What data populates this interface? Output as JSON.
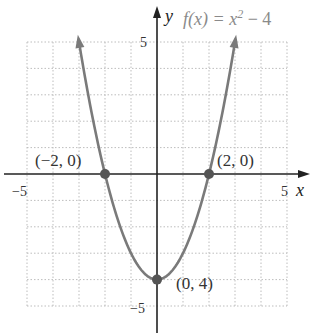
{
  "chart_data": {
    "type": "line",
    "title_parts": {
      "prefix": "f(x) = x",
      "exponent": "2",
      "suffix": " − 4"
    },
    "xlabel": "x",
    "ylabel": "y",
    "xlim": [
      -5,
      5
    ],
    "ylim": [
      -5,
      5
    ],
    "grid": true,
    "x_ticks": [
      {
        "value": -5,
        "label": "−5"
      },
      {
        "value": 5,
        "label": "5"
      }
    ],
    "y_ticks": [
      {
        "value": 5,
        "label": "5"
      },
      {
        "value": -5,
        "label": "−5"
      }
    ],
    "series": [
      {
        "name": "f(x) = x^2 - 4",
        "function": "x^2 - 4",
        "x": [
          -3,
          -2.5,
          -2,
          -1.5,
          -1,
          -0.5,
          0,
          0.5,
          1,
          1.5,
          2,
          2.5,
          3
        ],
        "values": [
          5,
          2.25,
          0,
          -1.75,
          -3,
          -3.75,
          -4,
          -3.75,
          -3,
          -1.75,
          0,
          2.25,
          5
        ],
        "color": "#7a7a7a"
      }
    ],
    "points": [
      {
        "x": -2,
        "y": 0,
        "label": "(−2, 0)"
      },
      {
        "x": 2,
        "y": 0,
        "label": "(2, 0)"
      },
      {
        "x": 0,
        "y": -4,
        "label": "(0, 4)"
      }
    ]
  },
  "colors": {
    "curve": "#7a7a7a",
    "axis": "#222222",
    "grid": "#bdbdbd",
    "point": "#555555",
    "title": "#8a8a8a"
  }
}
